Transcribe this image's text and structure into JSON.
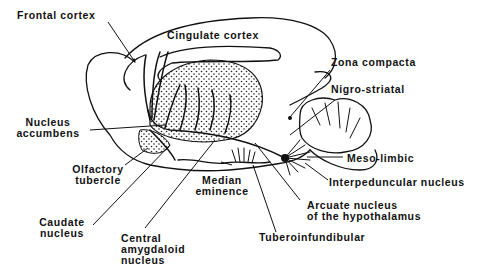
{
  "diagram": {
    "type": "anatomical-diagram",
    "colors": {
      "ink": "#111111",
      "background": "#ffffff",
      "stipple": "#222222"
    },
    "labels": {
      "frontal_cortex": "Frontal cortex",
      "cingulate_cortex": "Cingulate cortex",
      "zona_compacta": "Zona compacta",
      "nigro_striatal": "Nigro-striatal",
      "nucleus_accumbens": "Nucleus\naccumbens",
      "olfactory_tubercle": "Olfactory\ntubercle",
      "median_eminence": "Median\neminence",
      "meso_limbic": "Meso-limbic",
      "interpeduncular_nucleus": "Interpeduncular nucleus",
      "caudate_nucleus": "Caudate\nnucleus",
      "central_amygdaloid_nucleus": "Central\namygdaloid\nnucleus",
      "arcuate_nucleus": "Arcuate nucleus\nof the hypothalamus",
      "tuberoinfundibular": "Tuberoinfundibular"
    },
    "pathways": [
      "Nigro-striatal",
      "Meso-limbic",
      "Tuberoinfundibular"
    ]
  }
}
